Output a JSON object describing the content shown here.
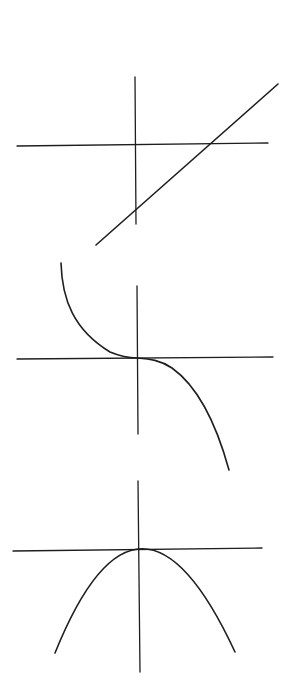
{
  "diagram": {
    "stroke_color": "#1e1e1e",
    "background": "#ffffff",
    "graphs": [
      {
        "id": "linear",
        "kind": "increasing line with positive slope, negative y-intercept, positive x-intercept",
        "x_axis": [
          [
            17,
            146
          ],
          [
            268,
            143
          ]
        ],
        "y_axis": [
          [
            135,
            77
          ],
          [
            136,
            224
          ]
        ],
        "curve": "M96,245 L278,84"
      },
      {
        "id": "cubic",
        "kind": "decreasing cubic-like curve (y = -x^3) through origin with horizontal inflection",
        "x_axis": [
          [
            17,
            359
          ],
          [
            273,
            357
          ]
        ],
        "y_axis": [
          [
            137,
            286
          ],
          [
            138,
            434
          ]
        ],
        "curve": "M61,263 C62,300 74,330 110,352 C122,357 130,358 137,358 C150,359 160,360 172,368 C200,388 218,430 229,470"
      },
      {
        "id": "parabola",
        "kind": "downward-opening parabola with vertex at origin",
        "x_axis": [
          [
            13,
            551
          ],
          [
            262,
            548
          ]
        ],
        "y_axis": [
          [
            138,
            481
          ],
          [
            140,
            672
          ]
        ],
        "curve": "M55,653 Q139,445 235,652"
      }
    ]
  }
}
